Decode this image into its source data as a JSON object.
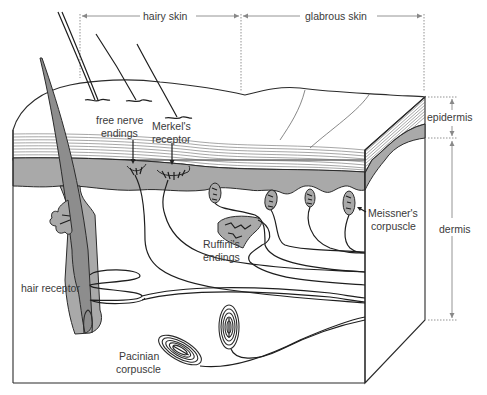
{
  "figure": {
    "regions": {
      "hairy_skin": "hairy skin",
      "glabrous_skin": "glabrous skin"
    },
    "layers": {
      "epidermis": "epidermis",
      "dermis": "dermis"
    },
    "labels": {
      "free_nerve_endings_line1": "free nerve",
      "free_nerve_endings_line2": "endings",
      "merkels_receptor_line1": "Merkel's",
      "merkels_receptor_line2": "receptor",
      "ruffinis_endings_line1": "Ruffini's",
      "ruffinis_endings_line2": "endings",
      "meissners_corpuscle_line1": "Meissner's",
      "meissners_corpuscle_line2": "corpuscle",
      "hair_receptor": "hair receptor",
      "pacinian_corpuscle_line1": "Pacinian",
      "pacinian_corpuscle_line2": "corpuscle"
    },
    "colors": {
      "tissue_gray": "#a9a9a9",
      "follicle_gray": "#8d8d8d",
      "line": "#2b2b2b",
      "label_text": "#3a3a3a",
      "dimension_line": "#888888"
    }
  }
}
